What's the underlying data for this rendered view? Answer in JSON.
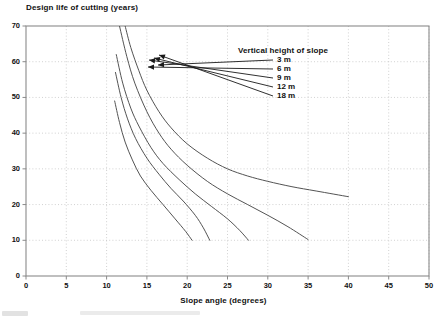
{
  "chart_data": {
    "type": "line",
    "title": "Design life of cutting (years)",
    "xlabel": "Slope angle (degrees)",
    "ylabel": "Design life of cutting (years)",
    "xlim": [
      0,
      50
    ],
    "ylim": [
      0,
      70
    ],
    "xticks": [
      0,
      5,
      10,
      15,
      20,
      25,
      30,
      35,
      40,
      45,
      50
    ],
    "yticks": [
      0,
      10,
      20,
      30,
      40,
      50,
      60,
      70
    ],
    "grid": true,
    "grid_style": "dotted",
    "legend_title": "Vertical height of slope",
    "legend_position": "inside-top-right",
    "series": [
      {
        "name": "3 m",
        "points": [
          [
            12.3,
            70.0
          ],
          [
            13.0,
            64.0
          ],
          [
            14.0,
            57.5
          ],
          [
            15.0,
            52.0
          ],
          [
            16.5,
            46.0
          ],
          [
            18.0,
            41.5
          ],
          [
            20.0,
            37.0
          ],
          [
            22.5,
            33.0
          ],
          [
            25.0,
            30.0
          ],
          [
            27.5,
            28.0
          ],
          [
            30.0,
            26.5
          ],
          [
            33.0,
            25.0
          ],
          [
            36.0,
            23.8
          ],
          [
            40.0,
            22.2
          ]
        ]
      },
      {
        "name": "6 m",
        "points": [
          [
            11.6,
            70.0
          ],
          [
            12.5,
            61.5
          ],
          [
            13.5,
            54.0
          ],
          [
            15.0,
            46.0
          ],
          [
            16.5,
            40.0
          ],
          [
            18.0,
            35.5
          ],
          [
            20.0,
            31.0
          ],
          [
            22.5,
            26.5
          ],
          [
            25.0,
            23.0
          ],
          [
            27.5,
            20.0
          ],
          [
            30.0,
            17.0
          ],
          [
            32.5,
            13.8
          ],
          [
            35.0,
            10.2
          ]
        ]
      },
      {
        "name": "9 m",
        "points": [
          [
            11.2,
            62.0
          ],
          [
            12.0,
            54.0
          ],
          [
            13.0,
            47.0
          ],
          [
            14.0,
            42.0
          ],
          [
            15.5,
            36.0
          ],
          [
            17.0,
            31.5
          ],
          [
            19.0,
            27.0
          ],
          [
            21.0,
            23.0
          ],
          [
            23.0,
            19.5
          ],
          [
            25.0,
            16.0
          ],
          [
            26.5,
            12.8
          ],
          [
            27.6,
            10.0
          ]
        ]
      },
      {
        "name": "12 m",
        "points": [
          [
            11.1,
            57.0
          ],
          [
            11.8,
            50.0
          ],
          [
            12.6,
            44.0
          ],
          [
            13.6,
            38.5
          ],
          [
            15.0,
            33.0
          ],
          [
            16.5,
            28.5
          ],
          [
            18.0,
            24.5
          ],
          [
            19.5,
            21.0
          ],
          [
            21.0,
            17.0
          ],
          [
            22.0,
            13.5
          ],
          [
            22.8,
            10.0
          ]
        ]
      },
      {
        "name": "18 m",
        "points": [
          [
            11.0,
            49.0
          ],
          [
            11.6,
            43.0
          ],
          [
            12.3,
            37.5
          ],
          [
            13.2,
            32.5
          ],
          [
            14.2,
            28.0
          ],
          [
            15.5,
            24.0
          ],
          [
            17.0,
            20.0
          ],
          [
            18.5,
            16.0
          ],
          [
            19.8,
            12.5
          ],
          [
            20.6,
            10.0
          ]
        ]
      }
    ],
    "annotations": [
      {
        "label": "3 m",
        "label_x": 277,
        "label_y": 60,
        "tip_x": 158,
        "tip_y": 65
      },
      {
        "label": "6 m",
        "label_x": 277,
        "label_y": 69,
        "tip_x": 148,
        "tip_y": 67
      },
      {
        "label": "9 m",
        "label_x": 277,
        "label_y": 78,
        "tip_x": 149,
        "tip_y": 60
      },
      {
        "label": "12 m",
        "label_x": 277,
        "label_y": 87,
        "tip_x": 154,
        "tip_y": 58
      },
      {
        "label": "18 m",
        "label_x": 277,
        "label_y": 96,
        "tip_x": 159,
        "tip_y": 55
      }
    ]
  },
  "axes": {
    "y_tick_labels": [
      "70",
      "60",
      "50",
      "40",
      "30",
      "20",
      "10",
      "0"
    ],
    "x_tick_labels": [
      "0",
      "5",
      "10",
      "15",
      "20",
      "25",
      "30",
      "35",
      "40",
      "45",
      "50"
    ]
  },
  "legend": {
    "title": "Vertical height of slope",
    "items": [
      "3 m",
      "6 m",
      "9 m",
      "12 m",
      "18 m"
    ]
  },
  "colors": {
    "curve": "#4a4a4a",
    "axis": "#8a8a8a",
    "grid": "#bdbdbd",
    "text": "#111111",
    "background": "#ffffff"
  }
}
